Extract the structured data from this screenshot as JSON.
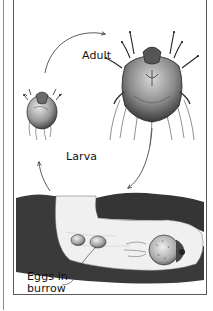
{
  "figure": {
    "labels": {
      "adult": "Adult",
      "larva": "Larva",
      "eggs_line1": "Eggs in",
      "eggs_line2": "burrow"
    },
    "stages": [
      {
        "name": "Larva",
        "position": "left"
      },
      {
        "name": "Adult",
        "position": "top-right"
      },
      {
        "name": "Eggs in burrow",
        "position": "bottom"
      }
    ],
    "cycle_arrows": [
      {
        "from": "Larva",
        "to": "Adult"
      },
      {
        "from": "Adult",
        "to": "Eggs in burrow"
      },
      {
        "from": "Eggs in burrow",
        "to": "Larva"
      }
    ],
    "colors": {
      "ink": "#1a1a1a",
      "soil": "#3a3a3a",
      "tunnel": "#f2f2f2",
      "frame": "#5a5a5a"
    }
  }
}
